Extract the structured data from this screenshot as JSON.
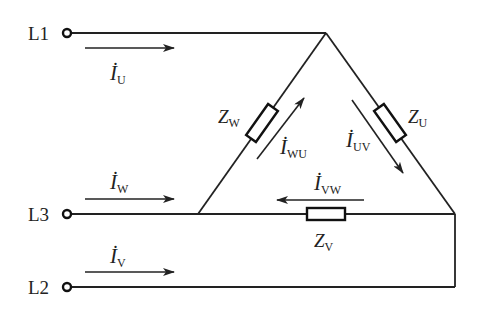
{
  "diagram": {
    "type": "three-phase delta-connected load circuit",
    "terminals": [
      {
        "label": "L1",
        "y": 33
      },
      {
        "label": "L3",
        "y": 214
      },
      {
        "label": "L2",
        "y": 287
      }
    ],
    "impedances": [
      {
        "name": "Z",
        "sub": "W",
        "branch": "left side (L1–L3)"
      },
      {
        "name": "Z",
        "sub": "U",
        "branch": "right side (L1–L2)"
      },
      {
        "name": "Z",
        "sub": "V",
        "branch": "bottom (L2–L3)"
      }
    ],
    "line_currents": [
      {
        "symbol": "İ",
        "sub": "U",
        "line": "L1",
        "direction": "right"
      },
      {
        "symbol": "İ",
        "sub": "W",
        "line": "L3",
        "direction": "right"
      },
      {
        "symbol": "İ",
        "sub": "V",
        "line": "L2",
        "direction": "right"
      }
    ],
    "phase_currents": [
      {
        "symbol": "İ",
        "sub": "WU",
        "direction": "up along left branch"
      },
      {
        "symbol": "İ",
        "sub": "UV",
        "direction": "down along right branch"
      },
      {
        "symbol": "İ",
        "sub": "VW",
        "direction": "left along bottom branch"
      }
    ],
    "colors": {
      "ink": "#222222",
      "background": "#ffffff"
    }
  }
}
